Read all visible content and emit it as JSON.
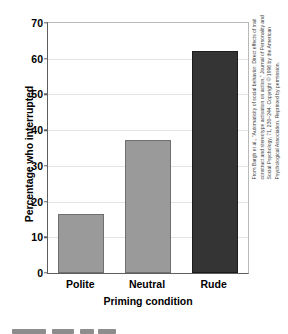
{
  "chart_data": {
    "type": "bar",
    "title": "",
    "categories": [
      "Polite",
      "Neutral",
      "Rude"
    ],
    "values": [
      16.5,
      37.2,
      62.2
    ],
    "series": [
      {
        "name": "Percentage who interrupted",
        "values": [
          16.5,
          37.2,
          62.2
        ]
      }
    ],
    "xlabel": "Priming condition",
    "ylabel": "Percentage who interrupted",
    "ylim": [
      0,
      70
    ],
    "yticks": [
      0,
      10,
      20,
      30,
      40,
      50,
      60,
      70
    ],
    "ytick_labels": [
      "0",
      "10",
      "20",
      "30",
      "40",
      "50",
      "60",
      "70"
    ],
    "grid": true,
    "legend": false,
    "bar_colors": [
      "#9a9a9a",
      "#9a9a9a",
      "#343434"
    ]
  },
  "axes": {
    "y_title": "Percentage who interrupted",
    "x_title": "Priming condition"
  },
  "credit": {
    "text": "From Bargh et al., \"Automaticity of social behavior: Direct effects of trait construct and stereotype activation on action,\" Journal of Personality and Social Psychology, 71, 230–244. Copyright © 1996 by the American Psychological Association. Reprinted by permission."
  },
  "colors": {
    "bar_light": "#9a9a9a",
    "bar_dark": "#343434",
    "grid": "#e4e4e4",
    "axis": "#5e5e5e",
    "text": "#000000"
  }
}
